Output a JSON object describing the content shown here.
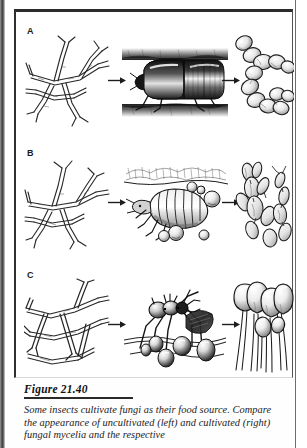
{
  "figure": {
    "number_label": "Figure 21.40",
    "caption": "Some insects cultivate fungi as their food source. Compare the appearance of uncultivated (left) and cultivated (right) fungal mycelia and the respective",
    "panels": [
      {
        "id": "A",
        "label": "A",
        "left_illustration": "branching-hyphal-mycelium",
        "middle_illustration": "beetle-in-wood-gallery",
        "right_illustration": "yeast-like-budding-cell-chains",
        "arrow_1": "arrow-right",
        "arrow_2": "arrow-right"
      },
      {
        "id": "B",
        "label": "B",
        "left_illustration": "branching-hyphal-mycelium",
        "middle_illustration": "ambrosia-beetle-larva-with-spore-droplets",
        "right_illustration": "swollen-ambrosial-hyphae-with-buds",
        "arrow_1": "arrow-right",
        "arrow_2": "arrow-right"
      },
      {
        "id": "C",
        "label": "C",
        "left_illustration": "branching-hyphal-mycelium",
        "middle_illustration": "leafcutter-ant-on-fungus-garden",
        "right_illustration": "club-shaped-gongylidia-swollen-hyphal-tips",
        "arrow_1": "arrow-right",
        "arrow_2": "arrow-right"
      }
    ]
  },
  "colors": {
    "ink": "#1a1a1a",
    "frame": "#2b2b2b",
    "rule": "#2a2a2a",
    "page": "#ffffff",
    "scan_edge": "#3c3c3c"
  }
}
